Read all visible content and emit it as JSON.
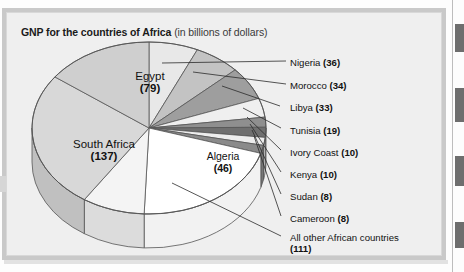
{
  "figure": {
    "title_bold": "GNP for the countries of Africa",
    "title_regular": "(in billions of dollars)",
    "colors": {
      "panel_bg": "#efefef",
      "frame": "#c9c9c9",
      "stroke": "#555555",
      "text": "#111111"
    }
  },
  "chart_data": {
    "type": "pie",
    "title": "GNP for the countries of Africa (in billions of dollars)",
    "units": "billions of dollars",
    "total": 531,
    "legend_position": "right-callouts",
    "grid": false,
    "categories": [
      "Nigeria",
      "Morocco",
      "Libya",
      "Tunisia",
      "Ivory Coast",
      "Kenya",
      "Sudan",
      "Cameroon",
      "All other African countries",
      "Algeria",
      "South Africa",
      "Egypt"
    ],
    "values": [
      36,
      34,
      33,
      19,
      10,
      10,
      8,
      8,
      111,
      46,
      137,
      79
    ],
    "slices": [
      {
        "name": "Nigeria",
        "value": 36,
        "label": "Nigeria (36)",
        "value_text": "(36)",
        "color": "#e8e8e8",
        "side_color": "#d2d2d2",
        "label_kind": "callout"
      },
      {
        "name": "Morocco",
        "value": 34,
        "label": "Morocco (34)",
        "value_text": "(34)",
        "color": "#c3c3c3",
        "side_color": "#ababab",
        "label_kind": "callout"
      },
      {
        "name": "Libya",
        "value": 33,
        "label": "Libya (33)",
        "value_text": "(33)",
        "color": "#9e9e9e",
        "side_color": "#8a8a8a",
        "label_kind": "callout"
      },
      {
        "name": "Tunisia",
        "value": 19,
        "label": "Tunisia (19)",
        "value_text": "(19)",
        "color": "#efefef",
        "side_color": "#d6d6d6",
        "label_kind": "callout"
      },
      {
        "name": "Ivory Coast",
        "value": 10,
        "label": "Ivory Coast (10)",
        "value_text": "(10)",
        "color": "#8f8f8f",
        "side_color": "#7c7c7c",
        "label_kind": "callout"
      },
      {
        "name": "Kenya",
        "value": 10,
        "label": "Kenya (10)",
        "value_text": "(10)",
        "color": "#6f6f6f",
        "side_color": "#606060",
        "label_kind": "callout"
      },
      {
        "name": "Sudan",
        "value": 8,
        "label": "Sudan (8)",
        "value_text": "(8)",
        "color": "#ededed",
        "side_color": "#d4d4d4",
        "label_kind": "callout"
      },
      {
        "name": "Cameroon",
        "value": 8,
        "label": "Cameroon (8)",
        "value_text": "(8)",
        "color": "#8a8a8a",
        "side_color": "#767676",
        "label_kind": "callout"
      },
      {
        "name": "All other African countries",
        "value": 111,
        "label": "All other African countries (111)",
        "value_text": "(111)",
        "color": "#ffffff",
        "side_color": "#f2f2f2",
        "label_kind": "callout"
      },
      {
        "name": "Algeria",
        "value": 46,
        "label": "Algeria (46)",
        "value_text": "(46)",
        "color": "#f4f4f4",
        "side_color": "#dcdcdc",
        "label_kind": "inside"
      },
      {
        "name": "South Africa",
        "value": 137,
        "label": "South Africa (137)",
        "value_text": "(137)",
        "color": "#d8d8d8",
        "side_color": "#c0c0c0",
        "label_kind": "inside"
      },
      {
        "name": "Egypt",
        "value": 79,
        "label": "Egypt (79)",
        "value_text": "(79)",
        "color": "#cfcfcf",
        "side_color": "#b7b7b7",
        "label_kind": "inside"
      }
    ]
  },
  "callouts": [
    {
      "name": "Nigeria",
      "value_text": "(36)",
      "x": 290,
      "y": 57,
      "lx": 286,
      "ly": 61,
      "px": 162,
      "py": 63
    },
    {
      "name": "Morocco",
      "value_text": "(34)",
      "x": 290,
      "y": 80,
      "lx": 286,
      "ly": 84,
      "px": 193,
      "py": 72
    },
    {
      "name": "Libya",
      "value_text": "(33)",
      "x": 290,
      "y": 102,
      "lx": 280,
      "ly": 106,
      "px": 222,
      "py": 86
    },
    {
      "name": "Tunisia",
      "value_text": "(19)",
      "x": 290,
      "y": 125,
      "lx": 281,
      "ly": 128,
      "px": 243,
      "py": 108
    },
    {
      "name": "Ivory Coast",
      "value_text": "(10)",
      "x": 290,
      "y": 147,
      "lx": 281,
      "ly": 150,
      "px": 247,
      "py": 117
    },
    {
      "name": "Kenya",
      "value_text": "(10)",
      "x": 290,
      "y": 169,
      "lx": 281,
      "ly": 172,
      "px": 250,
      "py": 124
    },
    {
      "name": "Sudan",
      "value_text": "(8)",
      "x": 290,
      "y": 191,
      "lx": 281,
      "ly": 194,
      "px": 252,
      "py": 130
    },
    {
      "name": "Cameroon",
      "value_text": "(8)",
      "x": 290,
      "y": 213,
      "lx": 281,
      "ly": 216,
      "px": 254,
      "py": 136
    },
    {
      "name": "All other African countries",
      "value_text": "(111)",
      "x": 290,
      "y": 232,
      "lx": 281,
      "ly": 236,
      "px": 172,
      "py": 183
    }
  ],
  "inside_labels": [
    {
      "name": "Egypt",
      "value_text": "(79)",
      "x": 115,
      "y": 70,
      "w": 70
    },
    {
      "name": "South Africa",
      "value_text": "(137)",
      "x": 57,
      "y": 138,
      "w": 94
    },
    {
      "name": "Algeria",
      "value_text": "(46)",
      "x": 192,
      "y": 150,
      "w": 62
    }
  ],
  "edge_tabs": [
    {
      "top": 24,
      "height": 28
    },
    {
      "top": 88,
      "height": 34
    },
    {
      "top": 156,
      "height": 30
    },
    {
      "top": 222,
      "height": 26
    }
  ]
}
